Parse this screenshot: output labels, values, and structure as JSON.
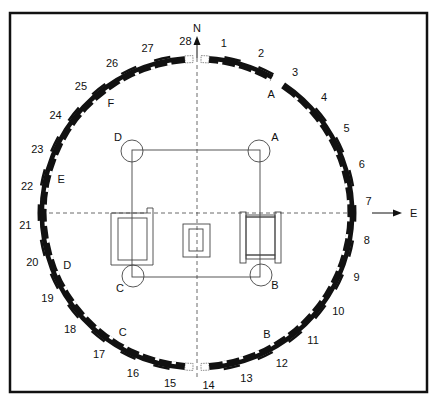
{
  "colors": {
    "ink": "#111111",
    "line": "#333333",
    "background": "#ffffff"
  },
  "frame": {
    "x": 10,
    "y": 13,
    "width": 417,
    "height": 379
  },
  "compass": {
    "north_label": "N",
    "east_label": "E"
  },
  "ring": {
    "cx": 197,
    "cy": 213,
    "r": 154,
    "numbered_stones": [
      "1",
      "2",
      "3",
      "4",
      "5",
      "6",
      "7",
      "8",
      "9",
      "10",
      "11",
      "12",
      "13",
      "14",
      "15",
      "16",
      "17",
      "18",
      "19",
      "20",
      "21",
      "22",
      "23",
      "24",
      "25",
      "26",
      "27",
      "28"
    ],
    "gap_labels": [
      {
        "label": "A",
        "angle": 32
      },
      {
        "label": "F",
        "angle": -38
      },
      {
        "label": "E",
        "angle": -76
      },
      {
        "label": "D",
        "angle": -112
      },
      {
        "label": "C",
        "angle": -148
      },
      {
        "label": "B",
        "angle": 150
      }
    ]
  },
  "central_structure": {
    "posts": [
      {
        "label": "D",
        "cx": 132,
        "cy": 151
      },
      {
        "label": "A",
        "cx": 259,
        "cy": 151
      },
      {
        "label": "C",
        "cx": 133,
        "cy": 276
      },
      {
        "label": "B",
        "cx": 261,
        "cy": 275
      }
    ],
    "square": {
      "x1": 132,
      "y1": 150,
      "x2": 260,
      "y2": 277
    }
  }
}
